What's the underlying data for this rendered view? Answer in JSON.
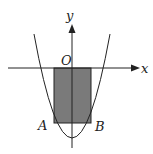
{
  "diagram": {
    "type": "parabola-inscribed-rectangle",
    "axes": {
      "x_label": "x",
      "y_label": "y",
      "origin_label": "O"
    },
    "points": {
      "A": "A",
      "B": "B"
    },
    "colors": {
      "stroke": "#222222",
      "fill": "#7a7a7a",
      "background": "#ffffff"
    }
  }
}
